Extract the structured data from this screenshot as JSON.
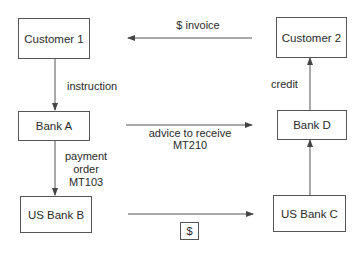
{
  "diagram": {
    "nodes": {
      "customer1": "Customer 1",
      "customer2": "Customer 2",
      "bank_a": "Bank A",
      "bank_d": "Bank D",
      "us_bank_b": "US Bank B",
      "us_bank_c": "US Bank C"
    },
    "edges": {
      "invoice": "$ invoice",
      "instruction": "instruction",
      "credit": "credit",
      "advice_line1": "advice to receive",
      "advice_line2": "MT210",
      "payment_line1": "payment",
      "payment_line2": "order",
      "payment_line3": "MT103",
      "dollar": "$"
    },
    "colors": {
      "line": "#555555",
      "text": "#2a2a2a"
    }
  }
}
